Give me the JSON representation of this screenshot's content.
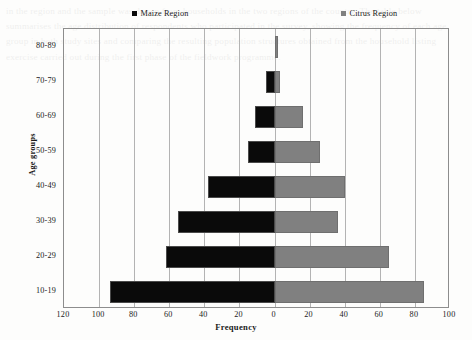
{
  "chart_data": {
    "type": "bar",
    "subtype": "population-pyramid",
    "title": "",
    "xlabel": "Frequency",
    "ylabel": "Age groups",
    "categories": [
      "10-19",
      "20-29",
      "30-39",
      "40-49",
      "50-59",
      "60-69",
      "70-79",
      "80-89"
    ],
    "series": [
      {
        "name": "Maize Region",
        "color": "#0a0a0a",
        "side": "left",
        "values": [
          94,
          62,
          55,
          38,
          15,
          11,
          5,
          0
        ]
      },
      {
        "name": "Citrus Region",
        "color": "#808080",
        "side": "right",
        "values": [
          85,
          65,
          36,
          40,
          26,
          16,
          3,
          2
        ]
      }
    ],
    "xticks": [
      "120",
      "100",
      "80",
      "60",
      "40",
      "20",
      "0",
      "20",
      "40",
      "60",
      "80",
      "100"
    ],
    "xtick_values": [
      -120,
      -100,
      -80,
      -60,
      -40,
      -20,
      0,
      20,
      40,
      60,
      80,
      100
    ],
    "xlim": [
      -120,
      100
    ],
    "grid": "vertical",
    "legend_position": "top"
  },
  "legend": {
    "items": [
      {
        "label": "Maize Region",
        "marker": "square-marker",
        "color": "#0a0a0a"
      },
      {
        "label": "Citrus Region",
        "marker": "square-marker",
        "color": "#808080"
      }
    ]
  },
  "background_text": "in the region and the sample was drawn from households in the two regions of the country. The table below summarises the age distribution of respondents who participated in the survey, showing the frequency of each age group in both study sites and comparing the resulting population structures obtained from the household listing exercise carried out during the first phase of the fieldwork programme."
}
